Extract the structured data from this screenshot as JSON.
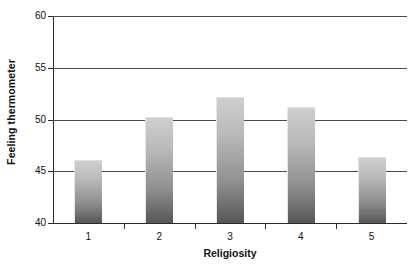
{
  "chart_data": {
    "type": "bar",
    "title": "",
    "xlabel": "Religiosity",
    "ylabel": "Feeling thermometer",
    "categories": [
      "1",
      "2",
      "3",
      "4",
      "5"
    ],
    "values": [
      46.1,
      50.2,
      52.2,
      51.2,
      46.4
    ],
    "ylim": [
      40,
      60
    ],
    "yticks": [
      40,
      45,
      50,
      55,
      60
    ],
    "ytick_labels": [
      "40",
      "45",
      "50",
      "55",
      "60"
    ],
    "grid": true,
    "grid_axis": "y",
    "legend": false,
    "legend_position": "none",
    "bar_fill_top_color": "#cfcfcf",
    "bar_fill_bottom_color": "#565656",
    "axis_color": "#2b2b2b",
    "gridline_color": "#4a4a4a",
    "background_color": "#ffffff",
    "annotations": []
  }
}
